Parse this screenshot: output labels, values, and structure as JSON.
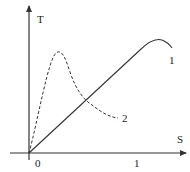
{
  "diagram": {
    "y_axis_label": "T",
    "x_axis_label": "S",
    "origin_label": "0",
    "x_tick_label": "1",
    "curves": [
      {
        "id": "1",
        "label": "1",
        "style": "solid",
        "description": "Linear rise from origin, rounding to a peak just past S=1 then slightly declining"
      },
      {
        "id": "2",
        "label": "2",
        "style": "dashed",
        "description": "Sharp rise from origin to a peak near S=0.25, then decaying tail"
      }
    ]
  }
}
